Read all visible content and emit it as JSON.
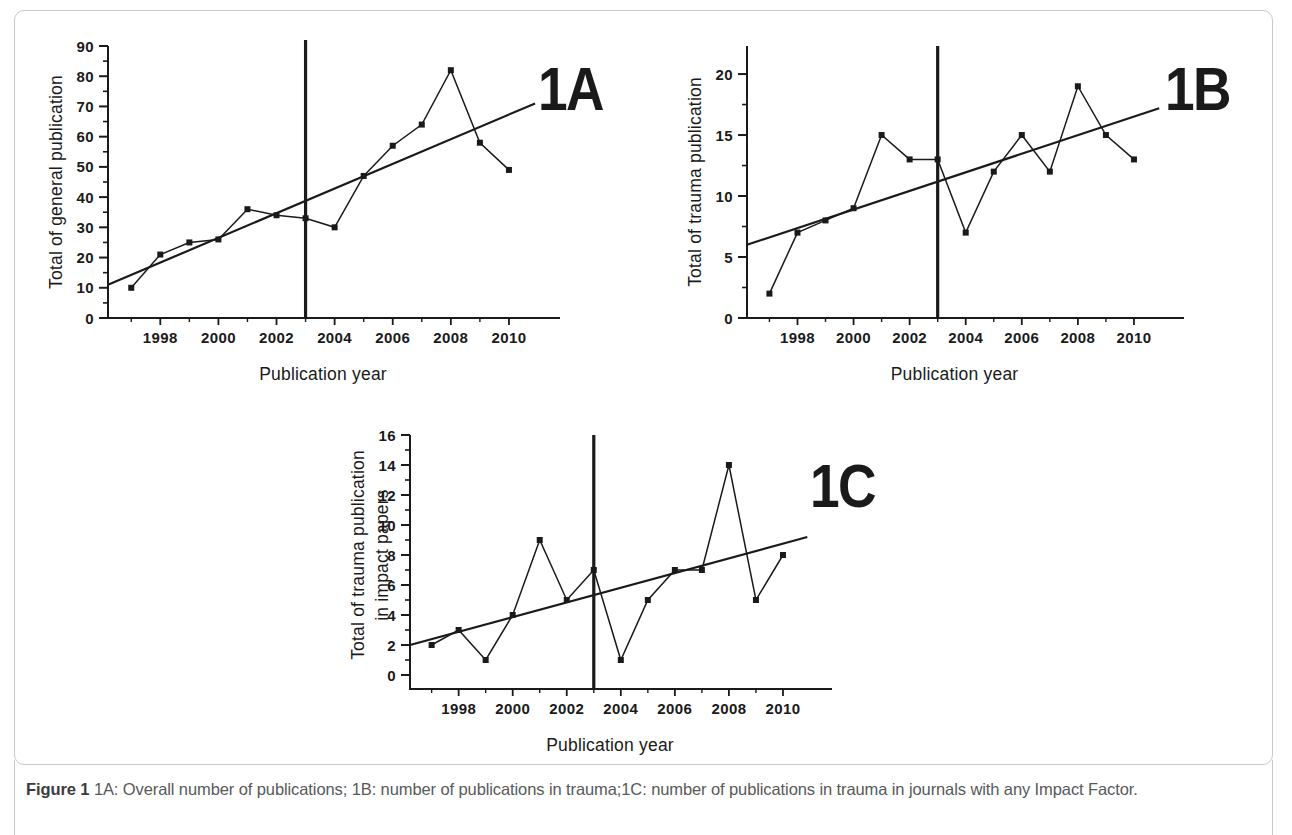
{
  "figure": {
    "caption_label": "Figure 1",
    "caption_text": "1A: Overall number of publications; 1B: number of publications in trauma;1C: number of publications in trauma in journals with any Impact Factor.",
    "frame_color": "#c9c9c9",
    "ink_color": "#1a1a1a"
  },
  "chart_data": [
    {
      "id": "1A",
      "tag": "1A",
      "type": "line",
      "title": "",
      "xlabel": "Publication year",
      "ylabel": "Total of general publication",
      "x": [
        1997,
        1998,
        1999,
        2000,
        2001,
        2002,
        2003,
        2004,
        2005,
        2006,
        2007,
        2008,
        2009,
        2010
      ],
      "values": [
        10,
        21,
        25,
        26,
        36,
        34,
        33,
        30,
        47,
        57,
        64,
        82,
        58,
        49
      ],
      "series": [
        {
          "name": "Total of general publication",
          "values": [
            10,
            21,
            25,
            26,
            36,
            34,
            33,
            30,
            47,
            57,
            64,
            82,
            58,
            49
          ]
        }
      ],
      "trendline": {
        "x": [
          1996.2,
          2010.9
        ],
        "y": [
          11,
          71
        ]
      },
      "marker_line": {
        "x": 2003,
        "y_top": 92,
        "label": "2003"
      },
      "xlim": [
        1996.2,
        2011.0
      ],
      "ylim": [
        0,
        90
      ],
      "yticks": [
        0,
        10,
        20,
        30,
        40,
        50,
        60,
        70,
        80,
        90
      ],
      "ytick_labels": [
        "0",
        "10",
        "20",
        "30",
        "40",
        "50",
        "60",
        "70",
        "80",
        "90"
      ],
      "xticks": [
        1998,
        2000,
        2002,
        2004,
        2006,
        2008,
        2010
      ],
      "xtick_labels": [
        "1998",
        "2000",
        "2002",
        "2004",
        "2006",
        "2008",
        "2010"
      ],
      "xminor": [
        1997,
        1999,
        2001,
        2003,
        2005,
        2007,
        2009
      ],
      "yminor_step": 5,
      "grid": false,
      "legend": "none"
    },
    {
      "id": "1B",
      "tag": "1B",
      "type": "line",
      "title": "",
      "xlabel": "Publication year",
      "ylabel": "Total of trauma publication",
      "x": [
        1997,
        1998,
        1999,
        2000,
        2001,
        2002,
        2003,
        2004,
        2005,
        2006,
        2007,
        2008,
        2009,
        2010
      ],
      "values": [
        2,
        7,
        8,
        9,
        15,
        13,
        13,
        7,
        12,
        15,
        12,
        19,
        15,
        13
      ],
      "series": [
        {
          "name": "Total of trauma publication",
          "values": [
            2,
            7,
            8,
            9,
            15,
            13,
            13,
            7,
            12,
            15,
            12,
            19,
            15,
            13
          ]
        }
      ],
      "trendline": {
        "x": [
          1996.2,
          2010.9
        ],
        "y": [
          6,
          17.2
        ]
      },
      "marker_line": {
        "x": 2003,
        "y_top": 22.3,
        "label": "2003"
      },
      "xlim": [
        1996.2,
        2011.0
      ],
      "ylim": [
        0,
        22.3
      ],
      "yticks": [
        0,
        5,
        10,
        15,
        20
      ],
      "ytick_labels": [
        "0",
        "5",
        "10",
        "15",
        "20"
      ],
      "xticks": [
        1998,
        2000,
        2002,
        2004,
        2006,
        2008,
        2010
      ],
      "xtick_labels": [
        "1998",
        "2000",
        "2002",
        "2004",
        "2006",
        "2008",
        "2010"
      ],
      "xminor": [
        1997,
        1999,
        2001,
        2003,
        2005,
        2007,
        2009
      ],
      "yminor_step": 2.5,
      "grid": false,
      "legend": "none"
    },
    {
      "id": "1C",
      "tag": "1C",
      "type": "line",
      "title": "",
      "xlabel": "Publication year",
      "ylabel": "Total of trauma publication in impact papers",
      "ylabel_lines": [
        "Total of trauma publication",
        "in impact papers"
      ],
      "x": [
        1997,
        1998,
        1999,
        2000,
        2001,
        2002,
        2003,
        2004,
        2005,
        2006,
        2007,
        2008,
        2009,
        2010
      ],
      "values": [
        2,
        3,
        1,
        4,
        9,
        5,
        7,
        1,
        5,
        7,
        7,
        14,
        5,
        8
      ],
      "series": [
        {
          "name": "Total of trauma publication in impact papers",
          "values": [
            2,
            3,
            1,
            4,
            9,
            5,
            7,
            1,
            5,
            7,
            7,
            14,
            5,
            8
          ]
        }
      ],
      "trendline": {
        "x": [
          1996.2,
          2010.9
        ],
        "y": [
          2,
          9.2
        ]
      },
      "marker_line": {
        "x": 2003,
        "y_top": 16,
        "label": "2003"
      },
      "xlim": [
        1996.2,
        2011.0
      ],
      "ylim": [
        0,
        16
      ],
      "yticks": [
        0,
        2,
        4,
        6,
        8,
        10,
        12,
        14,
        16
      ],
      "ytick_labels": [
        "0",
        "2",
        "4",
        "6",
        "8",
        "10",
        "12",
        "14",
        "16"
      ],
      "xticks": [
        1998,
        2000,
        2002,
        2004,
        2006,
        2008,
        2010
      ],
      "xtick_labels": [
        "1998",
        "2000",
        "2002",
        "2004",
        "2006",
        "2008",
        "2010"
      ],
      "xminor": [
        1997,
        1999,
        2001,
        2003,
        2005,
        2007,
        2009
      ],
      "yminor_step": 1,
      "grid": false,
      "legend": "none",
      "axis_below_zero": true
    }
  ]
}
